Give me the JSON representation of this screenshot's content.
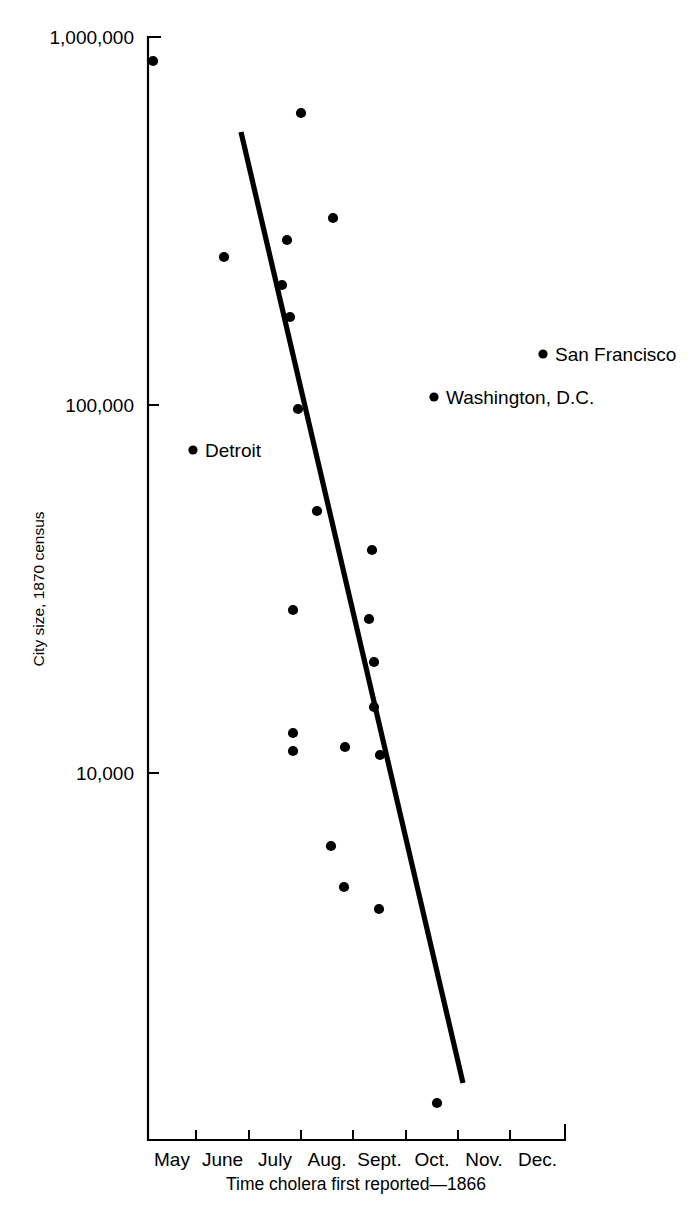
{
  "chart_data": {
    "type": "scatter",
    "title": "",
    "xlabel": "Time cholera first reported—1866",
    "ylabel": "City size, 1870 census",
    "x_tick_labels": [
      "May",
      "June",
      "July",
      "Aug.",
      "Sept.",
      "Oct.",
      "Nov.",
      "Dec."
    ],
    "y_tick_labels": [
      "1,000,000",
      "100,000",
      "10,000"
    ],
    "y_tick_values": [
      1000000,
      100000,
      10000
    ],
    "y_scale": "log",
    "grid": false,
    "legend": null,
    "annotations": [
      {
        "label": "San Francisco",
        "x_month": "Nov.",
        "y_value": 135000
      },
      {
        "label": "Washington, D.C.",
        "x_month": "Oct.",
        "y_value": 103000
      },
      {
        "label": "Detroit",
        "x_month": "June",
        "y_value": 72000
      }
    ],
    "points": [
      {
        "x_month": "May",
        "y_value": 925000
      },
      {
        "x_month": "June",
        "y_value": 239000
      },
      {
        "x_month": "July",
        "y_value": 605000
      },
      {
        "x_month": "July",
        "y_value": 275000
      },
      {
        "x_month": "July",
        "y_value": 205000
      },
      {
        "x_month": "July",
        "y_value": 174000
      },
      {
        "x_month": "July",
        "y_value": 97000
      },
      {
        "x_month": "July",
        "y_value": 26500
      },
      {
        "x_month": "July",
        "y_value": 12800
      },
      {
        "x_month": "July",
        "y_value": 11000
      },
      {
        "x_month": "Aug.",
        "y_value": 332000
      },
      {
        "x_month": "Aug.",
        "y_value": 53000
      },
      {
        "x_month": "Aug.",
        "y_value": 11500
      },
      {
        "x_month": "Aug.",
        "y_value": 6200
      },
      {
        "x_month": "Aug.",
        "y_value": 5000
      },
      {
        "x_month": "Sept.",
        "y_value": 40500
      },
      {
        "x_month": "Sept.",
        "y_value": 25000
      },
      {
        "x_month": "Sept.",
        "y_value": 20000
      },
      {
        "x_month": "Sept.",
        "y_value": 15800
      },
      {
        "x_month": "Sept.",
        "y_value": 10700
      },
      {
        "x_month": "Oct.",
        "y_value": 4300
      },
      {
        "x_month": "Oct.",
        "y_value": 1250
      }
    ],
    "points_px": [
      [
        153,
        61
      ],
      [
        224,
        257
      ],
      [
        301,
        113
      ],
      [
        287,
        240
      ],
      [
        282,
        285
      ],
      [
        290,
        317
      ],
      [
        298,
        409
      ],
      [
        293,
        610
      ],
      [
        293,
        733
      ],
      [
        293,
        751
      ],
      [
        333,
        218
      ],
      [
        317,
        511
      ],
      [
        345,
        747
      ],
      [
        331,
        846
      ],
      [
        344,
        887
      ],
      [
        372,
        550
      ],
      [
        369,
        619
      ],
      [
        374,
        662
      ],
      [
        374,
        707
      ],
      [
        380,
        755
      ],
      [
        379,
        909
      ],
      [
        437,
        1103
      ]
    ],
    "trend_line_px": {
      "x1": 241,
      "y1": 132,
      "x2": 463,
      "y2": 1083
    },
    "axis_px": {
      "x_left": 148,
      "x_right": 565,
      "y_top": 37,
      "y_bottom": 1140
    },
    "x_tick_px": [
      148,
      196,
      249,
      301,
      353,
      406,
      458,
      510,
      565
    ],
    "y_tick_px": [
      37,
      405,
      773
    ],
    "colors": {
      "ink": "#000000",
      "background": "#ffffff"
    }
  }
}
